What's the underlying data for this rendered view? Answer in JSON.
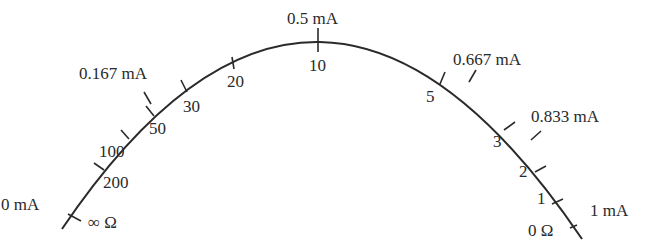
{
  "diagram": {
    "colors": {
      "stroke": "#2a2a2a",
      "text": "#2a2a2a",
      "background": "#ffffff"
    },
    "current_labels": [
      {
        "id": "0mA",
        "text": "0 mA"
      },
      {
        "id": "0167mA",
        "text": "0.167 mA"
      },
      {
        "id": "05mA",
        "text": "0.5 mA"
      },
      {
        "id": "0667mA",
        "text": "0.667 mA"
      },
      {
        "id": "0833mA",
        "text": "0.833 mA"
      },
      {
        "id": "1mA",
        "text": "1 mA"
      }
    ],
    "resistance_labels": [
      {
        "id": "inf",
        "text": "∞ Ω"
      },
      {
        "id": "200",
        "text": "200"
      },
      {
        "id": "100",
        "text": "100"
      },
      {
        "id": "50",
        "text": "50"
      },
      {
        "id": "30",
        "text": "30"
      },
      {
        "id": "20",
        "text": "20"
      },
      {
        "id": "10",
        "text": "10"
      },
      {
        "id": "5",
        "text": "5"
      },
      {
        "id": "3",
        "text": "3"
      },
      {
        "id": "2",
        "text": "2"
      },
      {
        "id": "1",
        "text": "1"
      },
      {
        "id": "0",
        "text": "0 Ω"
      }
    ]
  }
}
